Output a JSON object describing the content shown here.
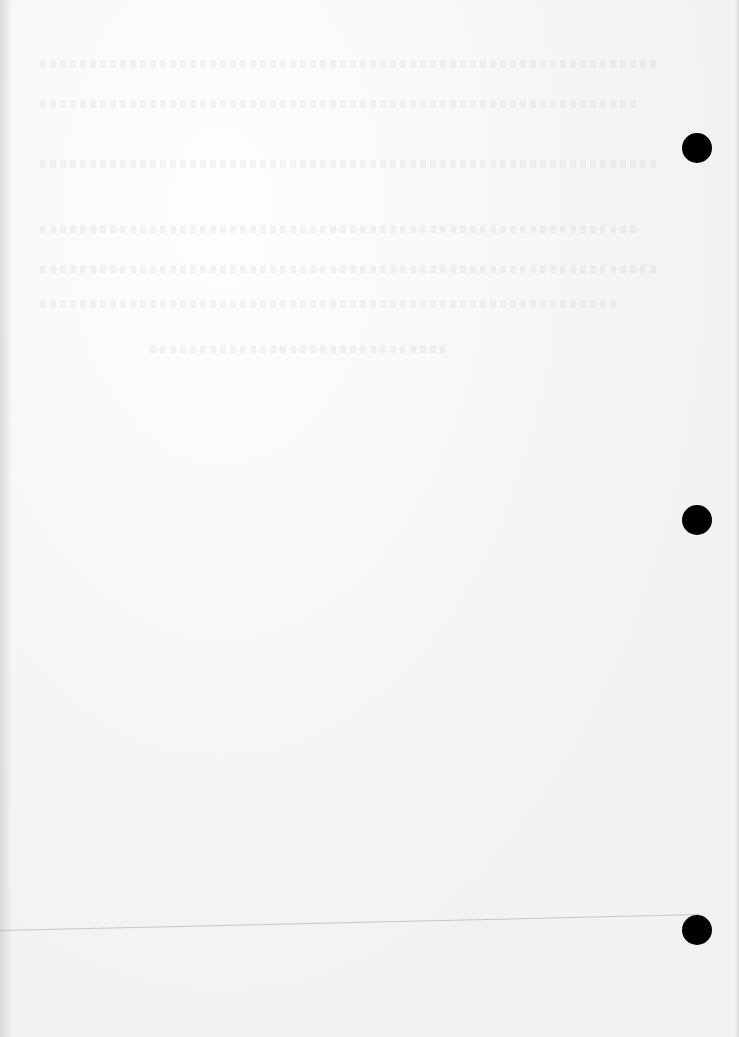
{
  "page": {
    "type": "blank scanned page",
    "background_color": "#f4f4f2",
    "binder_holes": [
      {
        "x": 697,
        "y": 148
      },
      {
        "x": 697,
        "y": 520
      },
      {
        "x": 697,
        "y": 930
      }
    ],
    "hole_color": "#000000",
    "bleed_through_lines": [
      {
        "top": 60,
        "left": 40,
        "width": 620
      },
      {
        "top": 100,
        "left": 40,
        "width": 600
      },
      {
        "top": 160,
        "left": 40,
        "width": 620
      },
      {
        "top": 225,
        "left": 40,
        "width": 600
      },
      {
        "top": 265,
        "left": 40,
        "width": 620
      },
      {
        "top": 300,
        "left": 40,
        "width": 580
      },
      {
        "top": 345,
        "left": 150,
        "width": 300
      }
    ]
  }
}
